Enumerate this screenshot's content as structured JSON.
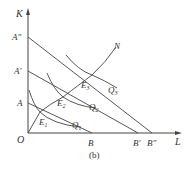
{
  "figure": {
    "caption": "(b)",
    "axes": {
      "y_label": "K",
      "x_label": "L",
      "origin_label": "O"
    },
    "y_intercepts": [
      "A",
      "A'",
      "A\""
    ],
    "x_intercepts": [
      "B",
      "B'",
      "B\""
    ],
    "equilibria": [
      "E1",
      "E2",
      "E3"
    ],
    "isoquants": [
      "Q1",
      "Q2",
      "Q3"
    ],
    "expansion_path_label": "N",
    "colors": {
      "line": "#444444",
      "text": "#333333"
    }
  },
  "labels": {
    "K": "K",
    "L": "L",
    "O": "O",
    "A": "A",
    "A1": "A′",
    "A2": "A″",
    "B": "B",
    "B1": "B′",
    "B2": "B″",
    "E1": "E",
    "E1sub": "1",
    "E2": "E",
    "E2sub": "2",
    "E3": "E",
    "E3sub": "3",
    "Q1": "Q",
    "Q1sub": "1",
    "Q2": "Q",
    "Q2sub": "2",
    "Q3": "Q",
    "Q3sub": "3",
    "N": "N",
    "caption": "(b)"
  }
}
